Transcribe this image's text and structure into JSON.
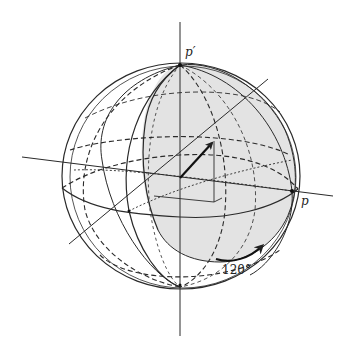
{
  "labels": {
    "top_pole": "p′",
    "right_point": "p",
    "rotation_angle": "120°"
  },
  "colors": {
    "stroke": "#2a2a2a",
    "shading": "#e2e2e2",
    "background": "#ffffff"
  }
}
